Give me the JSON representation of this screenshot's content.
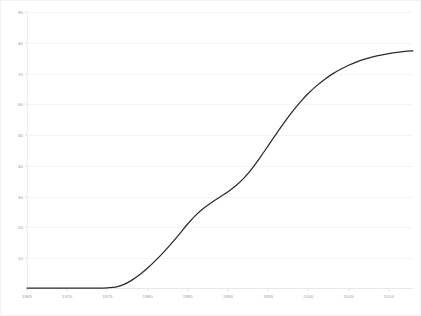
{
  "chart": {
    "title": "",
    "xlabel": "",
    "ylabel": "",
    "background_color": "#ffffff",
    "line_color": "#2b2b2b",
    "grid_color": "#f4f4f4",
    "tick_label_color": "#9a9a9a"
  },
  "chart_data": {
    "type": "line",
    "title": "",
    "xlabel": "",
    "ylabel": "",
    "xlim": [
      1965,
      2013
    ],
    "ylim": [
      0,
      90
    ],
    "grid": true,
    "legend": false,
    "x_tick_labels": [
      "1965",
      "1970",
      "1975",
      "1980",
      "1985",
      "1990",
      "1995",
      "2000",
      "2005",
      "2010"
    ],
    "x_ticks": [
      1965,
      1970,
      1975,
      1980,
      1985,
      1990,
      1995,
      2000,
      2005,
      2010
    ],
    "y_tick_labels": [
      "10",
      "20",
      "30",
      "40",
      "50",
      "60",
      "70",
      "80",
      "90"
    ],
    "y_ticks": [
      10,
      20,
      30,
      40,
      50,
      60,
      70,
      80,
      90
    ],
    "series": [
      {
        "name": "value",
        "x": [
          1965,
          1966,
          1967,
          1968,
          1969,
          1970,
          1971,
          1972,
          1973,
          1974,
          1975,
          1976,
          1977,
          1978,
          1979,
          1980,
          1981,
          1982,
          1983,
          1984,
          1985,
          1986,
          1987,
          1988,
          1989,
          1990,
          1991,
          1992,
          1993,
          1994,
          1995,
          1996,
          1997,
          1998,
          1999,
          2000,
          2001,
          2002,
          2003,
          2004,
          2005,
          2006,
          2007,
          2008,
          2009,
          2010,
          2011,
          2012,
          2013
        ],
        "values": [
          0.3,
          0.3,
          0.3,
          0.3,
          0.3,
          0.3,
          0.3,
          0.3,
          0.3,
          0.3,
          0.4,
          0.6,
          1.4,
          2.8,
          4.6,
          6.8,
          9.3,
          12.0,
          14.9,
          18.0,
          21.2,
          24.0,
          26.3,
          28.2,
          29.9,
          31.6,
          33.6,
          36.1,
          39.2,
          42.8,
          46.6,
          50.4,
          54.1,
          57.6,
          60.8,
          63.6,
          66.0,
          68.1,
          69.9,
          71.4,
          72.7,
          73.8,
          74.7,
          75.4,
          76.0,
          76.5,
          76.9,
          77.2,
          77.4
        ]
      }
    ]
  }
}
